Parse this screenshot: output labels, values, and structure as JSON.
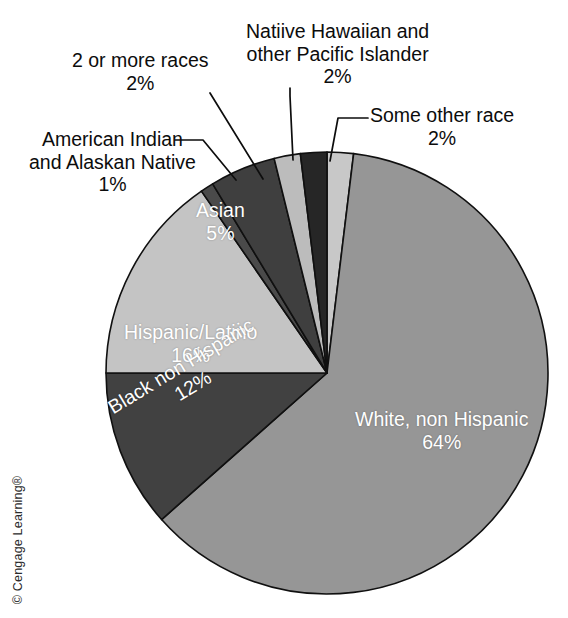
{
  "page": {
    "cut_off_header": "",
    "copyright": "© Cengage Learning®",
    "background": "#ffffff"
  },
  "chart_data": {
    "type": "pie",
    "title": "",
    "subtitle": "",
    "xlabel": "",
    "ylabel": "",
    "legend_position": "none",
    "grid": false,
    "units": "percent",
    "total": 104,
    "categories": [
      "Some other race",
      "White, non Hispanic",
      "Black non Hispanic",
      "Hispanic/Latino",
      "American Indian and Alaskan Native",
      "Asian",
      "2 or more races",
      "Natiive Hawaiian and other Pacific Islander"
    ],
    "values": [
      2,
      64,
      12,
      16,
      1,
      5,
      2,
      2
    ],
    "slices": [
      {
        "name": "some-other-race",
        "label": "Some other race",
        "percent_text": "2%",
        "value": 2,
        "color": "#c8c8c8",
        "label_placement": "external"
      },
      {
        "name": "white-non-hispanic",
        "label": "White, non Hispanic",
        "percent_text": "64%",
        "value": 64,
        "color": "#969696",
        "label_placement": "internal"
      },
      {
        "name": "black-non-hispanic",
        "label": "Black non Hispanic",
        "percent_text": "12%",
        "value": 12,
        "color": "#414141",
        "label_placement": "internal"
      },
      {
        "name": "hispanic-latino",
        "label": "Hispanic/Latino",
        "percent_text": "16%",
        "value": 16,
        "color": "#c4c4c4",
        "label_placement": "internal"
      },
      {
        "name": "american-indian-alaskan-native",
        "label": "American Indian and Alaskan Native",
        "label_line1": "American Indian",
        "label_line2": "and Alaskan Native",
        "percent_text": "1%",
        "value": 1,
        "color": "#4a4a4a",
        "label_placement": "external"
      },
      {
        "name": "asian",
        "label": "Asian",
        "percent_text": "5%",
        "value": 5,
        "color": "#3f3f3f",
        "label_placement": "internal"
      },
      {
        "name": "two-or-more-races",
        "label": "2 or more races",
        "percent_text": "2%",
        "value": 2,
        "color": "#bcbcbc",
        "label_placement": "external"
      },
      {
        "name": "native-hawaiian-pacific-islander",
        "label": "Natiive Hawaiian and other Pacific Islander",
        "label_line1": "Natiive Hawaiian and",
        "label_line2": "other Pacific Islander",
        "percent_text": "2%",
        "value": 2,
        "color": "#262626",
        "label_placement": "external"
      }
    ],
    "geometry": {
      "center_x": 327,
      "center_y": 373,
      "radius": 221,
      "start_angle_deg": 0,
      "direction": "clockwise"
    }
  }
}
